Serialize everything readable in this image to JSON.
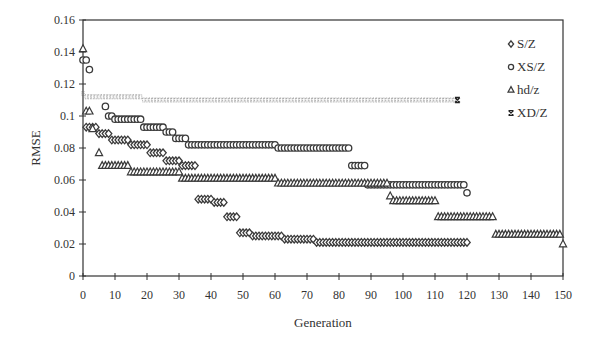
{
  "chart_data": {
    "type": "scatter",
    "title": "",
    "xlabel": "Generation",
    "ylabel": "RMSE",
    "xlim": [
      0,
      150
    ],
    "ylim": [
      0,
      0.16
    ],
    "x_ticks": [
      0,
      10,
      20,
      30,
      40,
      50,
      60,
      70,
      80,
      90,
      100,
      110,
      120,
      130,
      140,
      150
    ],
    "y_ticks": [
      0,
      0.02,
      0.04,
      0.06,
      0.08,
      0.1,
      0.12,
      0.14,
      0.16
    ],
    "y_tick_labels": [
      "0",
      "0.02",
      "0.04",
      "0.06",
      "0.08",
      "0.1",
      "0.12",
      "0.14",
      "0.16"
    ],
    "grid": false,
    "legend_position": "upper right (inside)",
    "series": [
      {
        "name": "S/Z",
        "marker": "diamond",
        "segments": [
          {
            "from": 1,
            "to": 4,
            "value": 0.093
          },
          {
            "from": 5,
            "to": 8,
            "value": 0.089
          },
          {
            "from": 9,
            "to": 14,
            "value": 0.085
          },
          {
            "from": 15,
            "to": 20,
            "value": 0.082
          },
          {
            "from": 21,
            "to": 25,
            "value": 0.077
          },
          {
            "from": 26,
            "to": 30,
            "value": 0.072
          },
          {
            "from": 31,
            "to": 35,
            "value": 0.069
          },
          {
            "from": 36,
            "to": 40,
            "value": 0.048
          },
          {
            "from": 41,
            "to": 44,
            "value": 0.046
          },
          {
            "from": 45,
            "to": 48,
            "value": 0.037
          },
          {
            "from": 49,
            "to": 52,
            "value": 0.027
          },
          {
            "from": 53,
            "to": 62,
            "value": 0.025
          },
          {
            "from": 63,
            "to": 72,
            "value": 0.023
          },
          {
            "from": 73,
            "to": 120,
            "value": 0.021
          }
        ]
      },
      {
        "name": "XS/Z",
        "marker": "circle",
        "segments": [
          {
            "from": 0,
            "to": 1,
            "value": 0.135
          },
          {
            "from": 2,
            "to": 2,
            "value": 0.129
          },
          {
            "from": 7,
            "to": 7,
            "value": 0.106
          },
          {
            "from": 8,
            "to": 9,
            "value": 0.1
          },
          {
            "from": 10,
            "to": 18,
            "value": 0.098
          },
          {
            "from": 19,
            "to": 25,
            "value": 0.093
          },
          {
            "from": 26,
            "to": 28,
            "value": 0.09
          },
          {
            "from": 29,
            "to": 32,
            "value": 0.086
          },
          {
            "from": 33,
            "to": 60,
            "value": 0.082
          },
          {
            "from": 61,
            "to": 83,
            "value": 0.08
          },
          {
            "from": 84,
            "to": 88,
            "value": 0.069
          },
          {
            "from": 89,
            "to": 119,
            "value": 0.057
          },
          {
            "from": 120,
            "to": 120,
            "value": 0.052
          }
        ]
      },
      {
        "name": "hd/z",
        "marker": "triangle",
        "segments": [
          {
            "from": 0,
            "to": 0,
            "value": 0.142
          },
          {
            "from": 1,
            "to": 2,
            "value": 0.103
          },
          {
            "from": 3,
            "to": 3,
            "value": 0.092
          },
          {
            "from": 5,
            "to": 5,
            "value": 0.077
          },
          {
            "from": 6,
            "to": 14,
            "value": 0.069
          },
          {
            "from": 15,
            "to": 30,
            "value": 0.065
          },
          {
            "from": 31,
            "to": 60,
            "value": 0.061
          },
          {
            "from": 61,
            "to": 95,
            "value": 0.058
          },
          {
            "from": 96,
            "to": 96,
            "value": 0.05
          },
          {
            "from": 97,
            "to": 110,
            "value": 0.047
          },
          {
            "from": 111,
            "to": 128,
            "value": 0.037
          },
          {
            "from": 129,
            "to": 149,
            "value": 0.026
          },
          {
            "from": 150,
            "to": 150,
            "value": 0.02
          }
        ]
      },
      {
        "name": "XD/Z",
        "marker": "x-bar",
        "segments": [
          {
            "from": 0,
            "to": 0,
            "value": 0.114
          },
          {
            "from": 1,
            "to": 18,
            "value": 0.112
          },
          {
            "from": 19,
            "to": 117,
            "value": 0.11
          }
        ]
      }
    ]
  },
  "legend": {
    "items": [
      {
        "label": "S/Z",
        "symbol": "◇"
      },
      {
        "label": "XS/Z",
        "symbol": "○"
      },
      {
        "label": "hd/z",
        "symbol": "△"
      },
      {
        "label": "XD/Z",
        "symbol": "✖"
      }
    ]
  },
  "colors": {
    "marker_stroke": "#3a3a3a",
    "axis": "#333333",
    "background": "#ffffff"
  }
}
